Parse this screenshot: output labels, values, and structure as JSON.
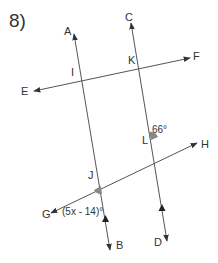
{
  "problem": {
    "number": "8)"
  },
  "points": {
    "A": "A",
    "B": "B",
    "C": "C",
    "D": "D",
    "E": "E",
    "F": "F",
    "G": "G",
    "H": "H",
    "I": "I",
    "J": "J",
    "K": "K",
    "L": "L"
  },
  "angles": {
    "L_angle": "66°",
    "J_angle": "(5x - 14)°"
  },
  "colors": {
    "line": "#555555",
    "text": "#333333",
    "angle_fill": "#888888"
  }
}
